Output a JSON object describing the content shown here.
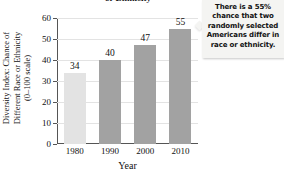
{
  "chart_data": {
    "type": "bar",
    "title": "or Ethnicity",
    "categories": [
      "1980",
      "1990",
      "2000",
      "2010"
    ],
    "values": [
      34,
      40,
      47,
      55
    ],
    "value_labels": [
      "34",
      "40",
      "47",
      "55"
    ],
    "series": [
      {
        "name": "Diversity Index",
        "values": [
          34,
          40,
          47,
          55
        ]
      }
    ],
    "xlabel": "Year",
    "ylabel_lines": [
      "Diversity Index: Chance of",
      "Different Race or Ethnicity",
      "(0–100 scale)"
    ],
    "ylim": [
      0,
      60
    ],
    "yticks": [
      0,
      10,
      20,
      30,
      40,
      50,
      60
    ],
    "ytick_labels": [
      "0",
      "10",
      "20",
      "30",
      "40",
      "50",
      "60"
    ],
    "grid": true,
    "legend": "none",
    "bar_colors": [
      "#e3e3e3",
      "#a2a2a2",
      "#a2a2a2",
      "#a2a2a2"
    ],
    "annotation": "There is a 55% chance that two randomly selected Americans differ in race or ethnicity."
  },
  "colors": {
    "bar_light": "#e3e3e3",
    "bar_dark": "#a2a2a2",
    "axis": "#555555",
    "grid": "#e3e3e3",
    "callout_bg": "#f4f4f2",
    "text": "#111111"
  },
  "callout": {
    "line1": "There is a 55%",
    "line2": "chance that two",
    "line3": "randomly selected",
    "line4": "Americans differ in",
    "line5": "race or ethnicity."
  }
}
